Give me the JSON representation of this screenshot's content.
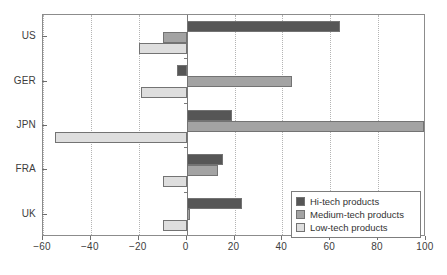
{
  "chart_data": {
    "type": "bar",
    "orientation": "horizontal",
    "title": "",
    "xlabel": "",
    "ylabel": "",
    "categories": [
      "US",
      "GER",
      "JPN",
      "FRA",
      "UK"
    ],
    "series": [
      {
        "name": "Hi-tech products",
        "color": "#565656",
        "values": [
          64,
          -4,
          19,
          15,
          23
        ]
      },
      {
        "name": "Medium-tech products",
        "color": "#a3a3a3",
        "values": [
          -10,
          44,
          99,
          13,
          1.5
        ]
      },
      {
        "name": "Low-tech products",
        "color": "#dedede",
        "values": [
          -20,
          -19,
          -55,
          -10,
          -10
        ]
      }
    ],
    "xlim": [
      -60,
      100
    ],
    "xticks": [
      -60,
      -40,
      -20,
      0,
      20,
      40,
      60,
      80,
      100
    ],
    "xticklabels": [
      "-60",
      "-40",
      "-20",
      "0",
      "20",
      "40",
      "60",
      "80",
      "100"
    ],
    "grid": true,
    "grid_axis": "x",
    "legend_position": "bottom-right"
  },
  "legend": {
    "items": [
      {
        "label": "Hi-tech products",
        "color": "#565656"
      },
      {
        "label": "Medium-tech products",
        "color": "#a3a3a3"
      },
      {
        "label": "Low-tech products",
        "color": "#dedede"
      }
    ]
  }
}
